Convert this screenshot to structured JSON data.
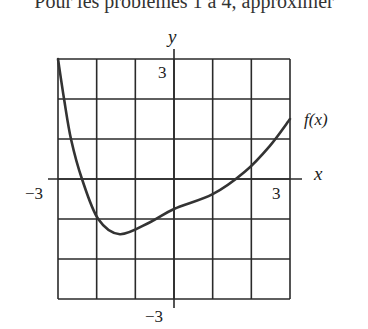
{
  "header": {
    "cut_text": "Pour les problèmes 1 à 4, approximer"
  },
  "chart_data": {
    "type": "line",
    "title": "",
    "xlabel": "x",
    "ylabel": "y",
    "curve_label": "f(x)",
    "xlim": [
      -3,
      3
    ],
    "ylim": [
      -3,
      3
    ],
    "grid": true,
    "grid_step": 1,
    "tick_labels": {
      "x_min": "−3",
      "x_max": "3",
      "y_min": "−3",
      "y_max": "3"
    },
    "series": [
      {
        "name": "f(x)",
        "x": [
          -3.0,
          -2.84,
          -2.66,
          -2.38,
          -1.96,
          -1.4,
          -0.62,
          0.0,
          1.0,
          1.83,
          2.48,
          3.0
        ],
        "y": [
          3.0,
          1.98,
          0.98,
          0.0,
          -1.0,
          -1.38,
          -1.08,
          -0.75,
          -0.38,
          0.18,
          0.83,
          1.5
        ]
      }
    ],
    "colors": {
      "grid": "#2a2a2a",
      "curve": "#333333"
    }
  }
}
